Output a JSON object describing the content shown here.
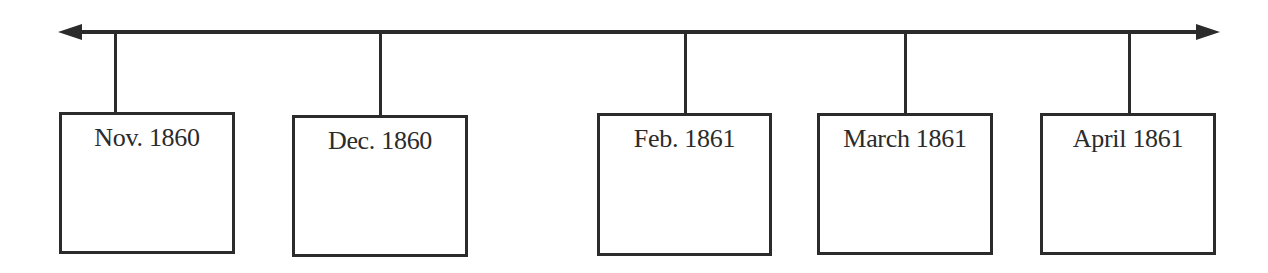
{
  "timeline": {
    "line_color": "#2b2b2b",
    "arrows": {
      "left": "arrow-left-icon",
      "right": "arrow-right-icon"
    },
    "events": [
      {
        "label": "Nov. 1860",
        "content": ""
      },
      {
        "label": "Dec. 1860",
        "content": ""
      },
      {
        "label": "Feb. 1861",
        "content": ""
      },
      {
        "label": "March 1861",
        "content": ""
      },
      {
        "label": "April 1861",
        "content": ""
      }
    ]
  }
}
